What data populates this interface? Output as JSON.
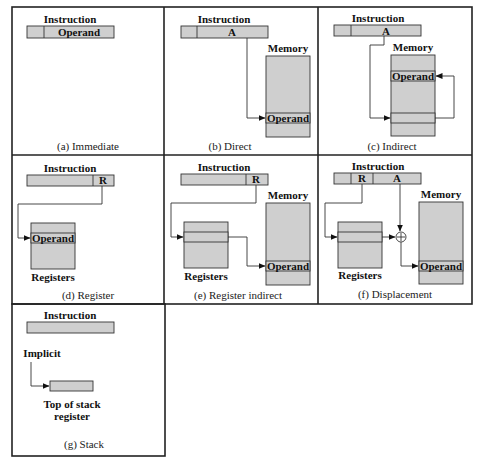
{
  "labels": {
    "instruction": "Instruction",
    "memory": "Memory",
    "registers": "Registers",
    "operand": "Operand",
    "field_a": "A",
    "field_r": "R",
    "implicit": "Implicit",
    "tos_line1": "Top of stack",
    "tos_line2": "register"
  },
  "panels": [
    {
      "id": "a",
      "caption": "(a) Immediate"
    },
    {
      "id": "b",
      "caption": "(b) Direct"
    },
    {
      "id": "c",
      "caption": "(c) Indirect"
    },
    {
      "id": "d",
      "caption": "(d) Register"
    },
    {
      "id": "e",
      "caption": "(e) Register indirect"
    },
    {
      "id": "f",
      "caption": "(f) Displacement"
    },
    {
      "id": "g",
      "caption": "(g) Stack"
    }
  ],
  "colors": {
    "fill": "#cfcfcf",
    "stroke": "#333333"
  }
}
